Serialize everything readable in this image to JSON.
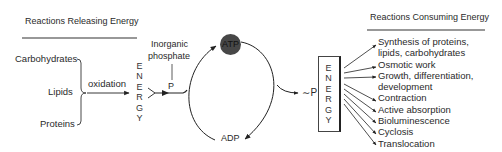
{
  "left_panel": {
    "header": "Reactions Releasing Energy",
    "sources": [
      {
        "label": "Carbohydrates"
      },
      {
        "label": "Lipids"
      },
      {
        "label": "Proteins"
      }
    ],
    "process_label": "oxidation",
    "energy_letters": [
      "E",
      "N",
      "E",
      "R",
      "G",
      "Y"
    ]
  },
  "cycle": {
    "inorganic_phosphate_label_line1": "Inorganic",
    "inorganic_phosphate_label_line2": "phosphate",
    "phosphate_symbol": "P",
    "atp_label": "ATP",
    "adp_label": "ADP",
    "high_energy_phosphate_label": "∼P",
    "atp_color": "#474747"
  },
  "right_panel": {
    "header": "Reactions Consuming Energy",
    "energy_letters": [
      "E",
      "N",
      "E",
      "R",
      "G",
      "Y"
    ],
    "consumers": [
      {
        "label": "Synthesis of proteins,"
      },
      {
        "label": "lipids, carbohydrates"
      },
      {
        "label": "Osmotic work"
      },
      {
        "label": "Growth, differentiation,"
      },
      {
        "label": "development"
      },
      {
        "label": "Contraction"
      },
      {
        "label": "Active absorption"
      },
      {
        "label": "Bioluminescence"
      },
      {
        "label": "Cyclosis"
      },
      {
        "label": "Translocation"
      }
    ]
  }
}
